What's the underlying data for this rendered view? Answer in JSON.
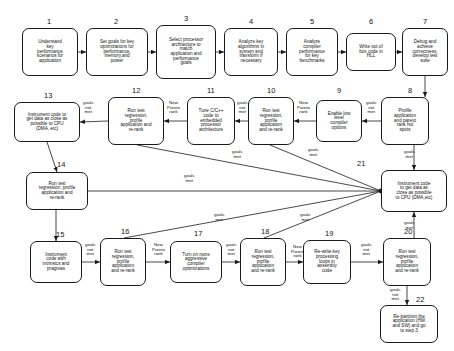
{
  "diagram": {
    "style": {
      "box_stroke": "#1a1a1a",
      "edge_stroke": "#1a1a1a",
      "background": "#ffffff",
      "text": "#111111"
    },
    "nodes": [
      {
        "id": "n1",
        "number": "1",
        "text": "Understand\nkey\nperformance\nscenarios for\napplication",
        "x": 22,
        "y": 28,
        "w": 56,
        "h": 48,
        "font": 4.6
      },
      {
        "id": "n2",
        "number": "2",
        "text": "Set goals for key\noptimizations for\nperformance,\nmemory,and\npower",
        "x": 86,
        "y": 28,
        "w": 62,
        "h": 48,
        "font": 4.6
      },
      {
        "id": "n3",
        "number": "3",
        "text": "Select processor\narchitecture to\nmatch\napplication and\nperformance\ngoals",
        "x": 156,
        "y": 25,
        "w": 60,
        "h": 54,
        "font": 4.6
      },
      {
        "id": "n4",
        "number": "4",
        "text": "Analyze key\nalgorithms in\nsystem and\ntransform if\nnecessary",
        "x": 224,
        "y": 28,
        "w": 54,
        "h": 48,
        "font": 4.6
      },
      {
        "id": "n5",
        "number": "5",
        "text": "Analyze\ncompiler\nperformance\nfor key\nbenchmarks",
        "x": 286,
        "y": 28,
        "w": 52,
        "h": 48,
        "font": 4.6
      },
      {
        "id": "n6",
        "number": "6",
        "text": "Write out of\nbox code in\nHLL",
        "x": 346,
        "y": 33,
        "w": 50,
        "h": 38,
        "font": 4.6
      },
      {
        "id": "n7",
        "number": "7",
        "text": "Debug and\nachieve\ncorrectness,\ndevelop test\nsuite",
        "x": 402,
        "y": 28,
        "w": 46,
        "h": 48,
        "font": 4.6
      },
      {
        "id": "n8",
        "number": "8",
        "text": "Profile\napplication\nand pareto\nrank hot\nspots",
        "x": 381,
        "y": 97,
        "w": 48,
        "h": 48,
        "font": 4.6
      },
      {
        "id": "n9",
        "number": "9",
        "text": "Enable low\nlevel\ncompiler\noptions",
        "x": 316,
        "y": 100,
        "w": 46,
        "h": 42,
        "font": 4.6
      },
      {
        "id": "n10",
        "number": "10",
        "text": "Run test\nregression,\nprofile\napplication\nand re-rank",
        "x": 248,
        "y": 97,
        "w": 46,
        "h": 48,
        "font": 4.6
      },
      {
        "id": "n11",
        "number": "11",
        "text": "Tune C/C++\ncode to\nembedded\nprocessor\narchitecture",
        "x": 187,
        "y": 97,
        "w": 48,
        "h": 48,
        "font": 4.6
      },
      {
        "id": "n12",
        "number": "12",
        "text": "Run test\nregression,\nprofile\napplication and\nre-rank",
        "x": 108,
        "y": 97,
        "w": 56,
        "h": 48,
        "font": 4.6
      },
      {
        "id": "n13",
        "number": "13",
        "text": "Instrument code to\nget data as close as\npossible to CPU\n(DMA, etc)",
        "x": 14,
        "y": 102,
        "w": 66,
        "h": 40,
        "font": 4.6
      },
      {
        "id": "n14",
        "number": "14",
        "text": "Run test\nregression, profile\napplication and\nre-rank",
        "x": 26,
        "y": 172,
        "w": 62,
        "h": 38,
        "font": 4.6
      },
      {
        "id": "n21",
        "number": "21",
        "text": "Instrument code\nto get data as\nclose as possible\nto CPU (DMA,etc)",
        "x": 381,
        "y": 170,
        "w": 66,
        "h": 42,
        "font": 4.6
      },
      {
        "id": "n15",
        "number": "15",
        "text": "Instrument\ncode with\nintrinsics and\npragmas",
        "x": 30,
        "y": 241,
        "w": 52,
        "h": 42,
        "font": 4.6
      },
      {
        "id": "n16",
        "number": "16",
        "text": "Run test\nregression,\nprofile\napplication\nand re-rank",
        "x": 100,
        "y": 238,
        "w": 46,
        "h": 48,
        "font": 4.6
      },
      {
        "id": "n17",
        "number": "17",
        "text": "Turn on more\naggressive\ncompiler\noptimizations",
        "x": 170,
        "y": 241,
        "w": 52,
        "h": 42,
        "font": 4.6
      },
      {
        "id": "n18",
        "number": "18",
        "text": "Run test\nregression,\nprofile\napplication\nand re-rank",
        "x": 240,
        "y": 238,
        "w": 46,
        "h": 48,
        "font": 4.6
      },
      {
        "id": "n19",
        "number": "19",
        "text": "Re-write key\nprocessing\nloops in\nassembly\ncode",
        "x": 303,
        "y": 240,
        "w": 48,
        "h": 44,
        "font": 4.6
      },
      {
        "id": "n20",
        "number": "20",
        "text": "Run test\nregression,\nprofile\napplication\nand re-rank",
        "x": 383,
        "y": 238,
        "w": 48,
        "h": 48,
        "font": 4.6
      },
      {
        "id": "n22",
        "number": "22",
        "text": "Re-partition the\napplication (HW\nand SW) and go\nto step 3",
        "x": 380,
        "y": 305,
        "w": 58,
        "h": 38,
        "font": 4.6
      }
    ],
    "node_numbers": [
      {
        "label": "1",
        "x": 47,
        "y": 18
      },
      {
        "label": "2",
        "x": 114,
        "y": 18
      },
      {
        "label": "3",
        "x": 184,
        "y": 15
      },
      {
        "label": "4",
        "x": 249,
        "y": 18
      },
      {
        "label": "5",
        "x": 310,
        "y": 18
      },
      {
        "label": "6",
        "x": 369,
        "y": 18
      },
      {
        "label": "7",
        "x": 423,
        "y": 18
      },
      {
        "label": "8",
        "x": 408,
        "y": 87
      },
      {
        "label": "9",
        "x": 337,
        "y": 87
      },
      {
        "label": "10",
        "x": 267,
        "y": 87
      },
      {
        "label": "11",
        "x": 207,
        "y": 87
      },
      {
        "label": "12",
        "x": 132,
        "y": 87
      },
      {
        "label": "13",
        "x": 44,
        "y": 92
      },
      {
        "label": "14",
        "x": 57,
        "y": 161
      },
      {
        "label": "21",
        "x": 357,
        "y": 160
      },
      {
        "label": "15",
        "x": 56,
        "y": 231
      },
      {
        "label": "16",
        "x": 121,
        "y": 228
      },
      {
        "label": "17",
        "x": 194,
        "y": 230
      },
      {
        "label": "18",
        "x": 261,
        "y": 228
      },
      {
        "label": "19",
        "x": 325,
        "y": 230
      },
      {
        "label": "20",
        "x": 404,
        "y": 228
      },
      {
        "label": "22",
        "x": 416,
        "y": 296
      }
    ],
    "edge_labels": [
      {
        "id": "el1",
        "text": "goals\nnot\nmet",
        "x": 83,
        "y": 101
      },
      {
        "id": "el2",
        "text": "New\nPareto\nrank",
        "x": 167,
        "y": 101
      },
      {
        "id": "el3",
        "text": "goals\nnot\nmet",
        "x": 237,
        "y": 101
      },
      {
        "id": "el4",
        "text": "New\nPareto\nrank",
        "x": 297,
        "y": 101
      },
      {
        "id": "el5",
        "text": "goals\nnot\nmet",
        "x": 366,
        "y": 101
      },
      {
        "id": "el6",
        "text": "goals\nmet",
        "x": 404,
        "y": 150
      },
      {
        "id": "el7",
        "text": "goals\nmet",
        "x": 308,
        "y": 148
      },
      {
        "id": "el8",
        "text": "goals\nmet",
        "x": 232,
        "y": 150
      },
      {
        "id": "el9",
        "text": "goals\nmet",
        "x": 184,
        "y": 174
      },
      {
        "id": "el10",
        "text": "goals\nmet",
        "x": 214,
        "y": 213
      },
      {
        "id": "el11",
        "text": "goals\nmet",
        "x": 300,
        "y": 213
      },
      {
        "id": "el12",
        "text": "goals\nmet",
        "x": 404,
        "y": 221
      },
      {
        "id": "el13",
        "text": "goals\nnot\nmet",
        "x": 85,
        "y": 243
      },
      {
        "id": "el14",
        "text": "New\nPareto\nrank",
        "x": 152,
        "y": 243
      },
      {
        "id": "el15",
        "text": "goals\nnot\nmet",
        "x": 226,
        "y": 243
      },
      {
        "id": "el16",
        "text": "New\nPareto\nrank",
        "x": 291,
        "y": 245
      },
      {
        "id": "el17",
        "text": "goals\nnot\nmet",
        "x": 361,
        "y": 243
      },
      {
        "id": "el18",
        "text": "goals\nnot\nmet",
        "x": 390,
        "y": 288
      }
    ],
    "edges": [
      {
        "id": "e1_2",
        "from": "1",
        "to": "2",
        "type": "arrow",
        "points": "78,52 86,52"
      },
      {
        "id": "e2_3",
        "from": "2",
        "to": "3",
        "type": "arrow",
        "points": "148,52 156,52"
      },
      {
        "id": "e3_4",
        "from": "3",
        "to": "4",
        "type": "arrow",
        "points": "216,52 224,52"
      },
      {
        "id": "e4_5",
        "from": "4",
        "to": "5",
        "type": "arrow",
        "points": "278,52 286,52"
      },
      {
        "id": "e5_6",
        "from": "5",
        "to": "6",
        "type": "arrow",
        "points": "338,52 346,52"
      },
      {
        "id": "e6_7",
        "from": "6",
        "to": "7",
        "type": "arrow",
        "points": "396,52 402,52"
      },
      {
        "id": "e7_8",
        "from": "7",
        "to": "8",
        "type": "arrow",
        "points": "425,76 425,97"
      },
      {
        "id": "e8_9",
        "from": "8",
        "to": "9",
        "type": "arrow",
        "points": "381,121 362,121"
      },
      {
        "id": "e9_10",
        "from": "9",
        "to": "10",
        "type": "arrow",
        "points": "316,121 294,121"
      },
      {
        "id": "e10_11",
        "from": "10",
        "to": "11",
        "type": "arrow",
        "points": "248,121 235,121"
      },
      {
        "id": "e11_12",
        "from": "11",
        "to": "12",
        "type": "arrow",
        "points": "187,121 164,121"
      },
      {
        "id": "e12_13",
        "from": "12",
        "to": "13",
        "type": "arrow",
        "points": "108,121 80,122"
      },
      {
        "id": "e13_14",
        "from": "13",
        "to": "14",
        "type": "arrow",
        "points": "47,142 57,172"
      },
      {
        "id": "e14_15",
        "from": "14",
        "to": "15",
        "type": "arrow",
        "points": "56,210 56,241"
      },
      {
        "id": "e15_16",
        "from": "15",
        "to": "16",
        "type": "arrow",
        "points": "82,262 100,262"
      },
      {
        "id": "e16_17",
        "from": "16",
        "to": "17",
        "type": "arrow",
        "points": "146,262 170,262"
      },
      {
        "id": "e17_18",
        "from": "17",
        "to": "18",
        "type": "arrow",
        "points": "222,262 240,262"
      },
      {
        "id": "e18_19",
        "from": "18",
        "to": "19",
        "type": "arrow",
        "points": "286,262 303,262"
      },
      {
        "id": "e19_20",
        "from": "19",
        "to": "20",
        "type": "arrow",
        "points": "351,262 383,262"
      },
      {
        "id": "e20_22",
        "from": "20",
        "to": "22",
        "type": "arrow",
        "points": "407,286 407,305"
      },
      {
        "id": "e8_21",
        "from": "8",
        "to": "21",
        "type": "arrow",
        "points": "414,145 414,170"
      },
      {
        "id": "e20_21",
        "from": "20",
        "to": "21",
        "type": "arrow",
        "points": "414,238 414,212"
      },
      {
        "id": "e10_21",
        "from": "10",
        "to": "21",
        "type": "line",
        "points": "270,145 381,191"
      },
      {
        "id": "e12_21",
        "from": "12",
        "to": "21",
        "type": "line",
        "points": "137,145 381,191"
      },
      {
        "id": "e14_21",
        "from": "14",
        "to": "21",
        "type": "line",
        "points": "88,191 381,191"
      },
      {
        "id": "e16_21",
        "from": "16",
        "to": "21",
        "type": "line",
        "points": "124,238 381,191"
      },
      {
        "id": "e18_21",
        "from": "18",
        "to": "21",
        "type": "line",
        "points": "264,238 381,191"
      }
    ]
  }
}
